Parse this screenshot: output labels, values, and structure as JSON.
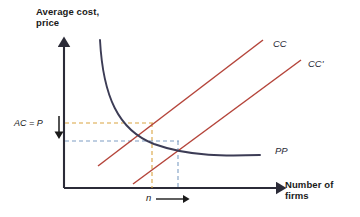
{
  "figure": {
    "kind": "economics-diagram",
    "background": "#ffffff"
  },
  "axes": {
    "y_title": "Average cost,\nprice",
    "x_title": "Number of\nfirms",
    "y_axis_name": "vertical-axis",
    "x_axis_name": "horizontal-axis",
    "axis_color": "#2b2b38",
    "origin": {
      "x": 64,
      "y": 188
    },
    "x_end": {
      "x": 285,
      "y": 188
    },
    "y_end": {
      "x": 64,
      "y": 38
    }
  },
  "curves": [
    {
      "id": "CC",
      "label": "CC",
      "type": "line",
      "color": "#b5453b",
      "start": {
        "x": 98,
        "y": 166
      },
      "end": {
        "x": 263,
        "y": 40
      },
      "description": "upward sloping cost curve"
    },
    {
      "id": "CCp",
      "label": "CC'",
      "type": "line",
      "color": "#b5453b",
      "start": {
        "x": 133,
        "y": 184
      },
      "end": {
        "x": 301,
        "y": 60
      },
      "description": "shifted-right cost curve"
    },
    {
      "id": "PP",
      "label": "PP",
      "type": "curve",
      "color": "#3c3c55",
      "start": {
        "x": 100,
        "y": 40
      },
      "end": {
        "x": 260,
        "y": 155
      },
      "description": "downward sloping convex price curve"
    }
  ],
  "guides": {
    "upper": {
      "name": "first-equilibrium-guides",
      "color": "#d9a441",
      "price_y": 123,
      "quantity_x": 152,
      "intersection": {
        "x": 152,
        "y": 123
      }
    },
    "lower": {
      "name": "second-equilibrium-guides",
      "color": "#7e9ec4",
      "price_y": 141,
      "quantity_x": 178,
      "intersection": {
        "x": 178,
        "y": 141
      }
    }
  },
  "annotations": {
    "ac_equals_p": "AC = P",
    "ac_arrow_direction": "down",
    "n_symbol": "n",
    "n_arrow_direction": "right"
  }
}
